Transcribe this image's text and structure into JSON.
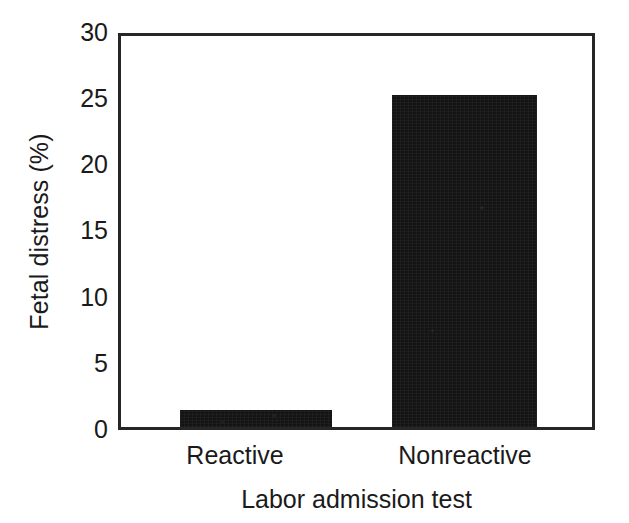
{
  "chart_data": {
    "type": "bar",
    "title": "",
    "subtitle": "",
    "xlabel": "Labor admission test",
    "ylabel": "Fetal distress (%)",
    "categories": [
      "Reactive",
      "Nonreactive"
    ],
    "values": [
      1.3,
      25.5
    ],
    "series": [
      {
        "name": "Fetal distress",
        "values": [
          1.3,
          25.5
        ]
      }
    ],
    "ylim": [
      0,
      30
    ],
    "yticks": [
      0,
      5,
      10,
      15,
      20,
      25,
      30
    ],
    "ytick_labels": [
      "0",
      "5",
      "10",
      "15",
      "20",
      "25",
      "30"
    ],
    "grid": false,
    "legend": false,
    "legend_position": "none",
    "annotations": [],
    "bar_color": "#141414",
    "axis_color": "#262626",
    "background_color": "#ffffff",
    "text_color": "#1a1a1a"
  },
  "axes": {
    "y_title": "Fetal distress (%)",
    "x_title": "Labor admission test"
  },
  "ticks": {
    "y": [
      {
        "label": "30",
        "value": 30
      },
      {
        "label": "25",
        "value": 25
      },
      {
        "label": "20",
        "value": 20
      },
      {
        "label": "15",
        "value": 15
      },
      {
        "label": "10",
        "value": 10
      },
      {
        "label": "5",
        "value": 5
      },
      {
        "label": "0",
        "value": 0
      }
    ]
  },
  "bars": [
    {
      "label": "Reactive",
      "value": 1.3
    },
    {
      "label": "Nonreactive",
      "value": 25.5
    }
  ]
}
